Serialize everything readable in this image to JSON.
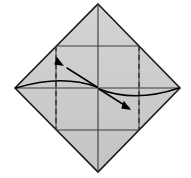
{
  "figure": {
    "background_color": "#ffffff"
  },
  "colors": {
    "paper_fill": "#c9c9c9",
    "paper_fill_light": "#d2d2d2",
    "outline": "#1a1a1a",
    "crease_line": "#3a3a3a",
    "dashed_line": "#2b2b2b",
    "arrow": "#000000"
  },
  "geometry": {
    "vertices": {
      "top": {
        "label": "top-vertex",
        "x": 98,
        "y": 4
      },
      "right": {
        "label": "right-vertex",
        "x": 180,
        "y": 88
      },
      "bottom": {
        "label": "bottom-vertex",
        "x": 98,
        "y": 172
      },
      "left": {
        "label": "left-vertex",
        "x": 15,
        "y": 88
      },
      "center": {
        "label": "center-point",
        "x": 98,
        "y": 88
      }
    },
    "edge_midpoints": {
      "upper_left": {
        "x": 56,
        "y": 46
      },
      "upper_right": {
        "x": 139,
        "y": 46
      },
      "lower_right": {
        "x": 139,
        "y": 130
      },
      "lower_left": {
        "x": 56,
        "y": 130
      }
    },
    "outline_path": "M98,4 L180,88 L98,172 L15,88 Z",
    "inner_square_path": "M56,46 L139,46 L139,130 L56,130 Z",
    "diagonal_vertical": "M98,4 L98,172",
    "diagonal_horizontal": "M15,88 L180,88",
    "dashed_fold_left": "M56,46 L56,130",
    "dashed_fold_right": "M139,46 L139,130",
    "arrow_curve_upper": "M16,88 Q62,74 97,87",
    "arrow_curve_lower": "M99,89 Q135,103 179,88",
    "arrow_shaft_upper": "M97,87 L67,68",
    "arrow_shaft_lower": "M99,89 L129,108",
    "arrowhead_upper": {
      "tip_x": 64,
      "tip_y": 66,
      "rotation_deg": 212
    },
    "arrowhead_lower": {
      "tip_x": 131,
      "tip_y": 110,
      "rotation_deg": 32
    }
  },
  "labels": {
    "paper_region_top": "top-facet",
    "paper_region_right": "right-facet",
    "paper_region_bottom": "bottom-facet",
    "paper_region_left": "left-facet"
  }
}
